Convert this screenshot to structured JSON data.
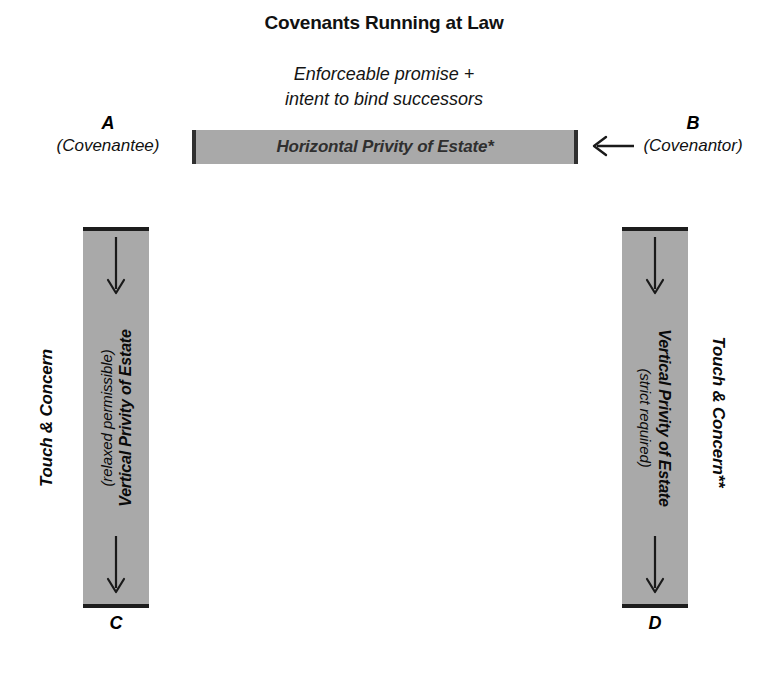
{
  "title": "Covenants Running at Law",
  "subtitle": {
    "line1": "Enforceable promise +",
    "line2": "intent to bind successors"
  },
  "horizontal": {
    "label": "Horizontal Privity of Estate*",
    "arrow_direction": "left",
    "arrow_icon": "left-arrow-icon"
  },
  "nodes": {
    "a": {
      "letter": "A",
      "role": "(Covenantee)"
    },
    "b": {
      "letter": "B",
      "role": "(Covenantor)"
    },
    "c": {
      "letter": "C",
      "role": ""
    },
    "d": {
      "letter": "D",
      "role": ""
    }
  },
  "columns": {
    "left": {
      "main": "Vertical Privity of Estate",
      "sub": "(relaxed permissible)",
      "outer_label": "Touch & Concern",
      "arrow_top_icon": "down-arrow-icon",
      "arrow_bottom_icon": "down-arrow-icon",
      "text_orientation": "bottom-to-top"
    },
    "right": {
      "main": "Vertical Privity of Estate",
      "sub": "(strict required)",
      "outer_label": "Touch & Concern**",
      "arrow_top_icon": "down-arrow-icon",
      "arrow_bottom_icon": "down-arrow-icon",
      "text_orientation": "top-to-bottom"
    }
  },
  "colors": {
    "bar_fill": "#a9a9a9",
    "bar_edge": "#303030",
    "bar_text": "#2f2f2f",
    "text": "#000000",
    "background": "#ffffff"
  }
}
